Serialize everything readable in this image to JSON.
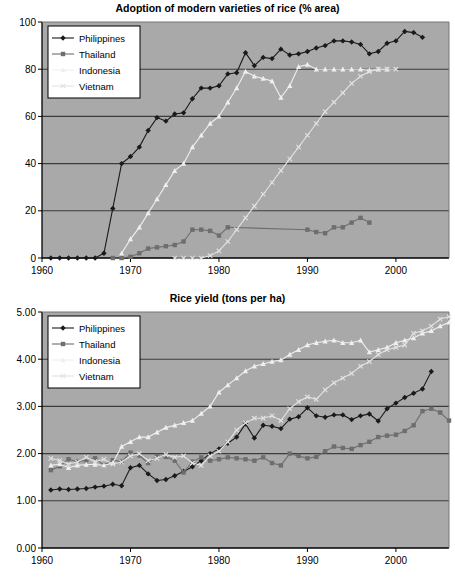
{
  "page": {
    "background": "#ffffff",
    "plot_background": "#a9a9a9",
    "grid_color": "#3c3c3c",
    "axis_color": "#000000"
  },
  "series_style": {
    "Philippines": {
      "color": "#1a1a1a",
      "marker": "diamond"
    },
    "Thailand": {
      "color": "#6e6e6e",
      "marker": "square"
    },
    "Indonesia": {
      "color": "#efefef",
      "marker": "triangle"
    },
    "Vietnam": {
      "color": "#e2e2e2",
      "marker": "cross"
    }
  },
  "chart_data": [
    {
      "id": "chart1",
      "type": "line",
      "title": "Adoption of modern varieties of rice (% area)",
      "xlabel": "",
      "ylabel": "",
      "xlim": [
        1960,
        2006
      ],
      "ylim": [
        0,
        100
      ],
      "xticks": [
        1960,
        1970,
        1980,
        1990,
        2000
      ],
      "yticks": [
        0,
        20,
        40,
        60,
        80,
        100
      ],
      "xtick_labels": [
        "1960",
        "1970",
        "1980",
        "1990",
        "2000"
      ],
      "ytick_labels": [
        "0",
        "20",
        "40",
        "60",
        "80",
        "100"
      ],
      "grid": true,
      "legend_position": "top-left",
      "legend": [
        "Philippines",
        "Thailand",
        "Indonesia",
        "Vietnam"
      ],
      "series": [
        {
          "name": "Philippines",
          "x": [
            1961,
            1962,
            1963,
            1964,
            1965,
            1966,
            1967,
            1968,
            1969,
            1970,
            1971,
            1972,
            1973,
            1974,
            1975,
            1976,
            1977,
            1978,
            1979,
            1980,
            1981,
            1982,
            1983,
            1984,
            1985,
            1986,
            1987,
            1988,
            1989,
            1990,
            1991,
            1992,
            1993,
            1994,
            1995,
            1996,
            1997,
            1998,
            1999,
            2000,
            2001,
            2002,
            2003
          ],
          "y": [
            0,
            0,
            0,
            0,
            0,
            0,
            2,
            21,
            40,
            43,
            47,
            54,
            59.5,
            58,
            61,
            61.5,
            67.5,
            72,
            72,
            73,
            78,
            78.5,
            87,
            81.5,
            85,
            84.5,
            88.5,
            86,
            86.5,
            87.5,
            89,
            90,
            92,
            92,
            91.5,
            90.5,
            86.5,
            87.5,
            91,
            92,
            96,
            95.5,
            93.5
          ]
        },
        {
          "name": "Thailand",
          "x": [
            1968,
            1969,
            1970,
            1971,
            1972,
            1973,
            1974,
            1975,
            1976,
            1977,
            1978,
            1979,
            1980,
            1981,
            1990,
            1991,
            1992,
            1993,
            1994,
            1995,
            1996,
            1997
          ],
          "y": [
            0,
            0,
            0.5,
            2,
            4,
            4.5,
            5,
            5.5,
            7,
            12,
            12,
            11.5,
            9.5,
            13,
            12,
            11,
            10.5,
            13,
            13,
            15,
            17,
            15
          ]
        },
        {
          "name": "Indonesia",
          "x": [
            1969,
            1970,
            1971,
            1972,
            1973,
            1974,
            1975,
            1976,
            1977,
            1978,
            1979,
            1980,
            1981,
            1982,
            1983,
            1984,
            1985,
            1986,
            1987,
            1988,
            1989,
            1990,
            1991,
            1992,
            1993,
            1994,
            1995,
            1996,
            1997,
            1998,
            1999
          ],
          "y": [
            2,
            8,
            13,
            19,
            25,
            31,
            37,
            40,
            47,
            52,
            57,
            60,
            66,
            72,
            79,
            77,
            76,
            75,
            68,
            73,
            81,
            82,
            80,
            80,
            80,
            80,
            80,
            80,
            79.5,
            80,
            80
          ]
        },
        {
          "name": "Vietnam",
          "x": [
            1975,
            1976,
            1977,
            1978,
            1979,
            1980,
            1981,
            1982,
            1983,
            1984,
            1985,
            1986,
            1987,
            1988,
            1989,
            1990,
            1991,
            1992,
            1993,
            1994,
            1995,
            1996,
            1997,
            1998,
            1999,
            2000
          ],
          "y": [
            0,
            0,
            0,
            0,
            1,
            3,
            7,
            12,
            17,
            22,
            27,
            32,
            37,
            42,
            47,
            52,
            57,
            62,
            66,
            70,
            74,
            77,
            79,
            80,
            80,
            80
          ]
        }
      ]
    },
    {
      "id": "chart2",
      "type": "line",
      "title": "Rice yield (tons per ha)",
      "xlabel": "",
      "ylabel": "",
      "xlim": [
        1960,
        2006
      ],
      "ylim": [
        0.0,
        5.0
      ],
      "xticks": [
        1960,
        1970,
        1980,
        1990,
        2000
      ],
      "yticks": [
        0.0,
        1.0,
        2.0,
        3.0,
        4.0,
        5.0
      ],
      "xtick_labels": [
        "1960",
        "1970",
        "1980",
        "1990",
        "2000"
      ],
      "ytick_labels": [
        "0.00",
        "1.00",
        "2.00",
        "3.00",
        "4.00",
        "5.00"
      ],
      "grid": true,
      "legend_position": "top-left",
      "legend": [
        "Philippines",
        "Thailand",
        "Indonesia",
        "Vietnam"
      ],
      "series": [
        {
          "name": "Philippines",
          "x": [
            1961,
            1962,
            1963,
            1964,
            1965,
            1966,
            1967,
            1968,
            1969,
            1970,
            1971,
            1972,
            1973,
            1974,
            1975,
            1976,
            1977,
            1978,
            1979,
            1980,
            1981,
            1982,
            1983,
            1984,
            1985,
            1986,
            1987,
            1988,
            1989,
            1990,
            1991,
            1992,
            1993,
            1994,
            1995,
            1996,
            1997,
            1998,
            1999,
            2000,
            2001,
            2002,
            2003,
            2004
          ],
          "y": [
            1.23,
            1.25,
            1.24,
            1.25,
            1.26,
            1.29,
            1.31,
            1.35,
            1.32,
            1.7,
            1.75,
            1.57,
            1.43,
            1.45,
            1.53,
            1.62,
            1.72,
            1.85,
            2.0,
            2.1,
            2.22,
            2.35,
            2.63,
            2.33,
            2.6,
            2.58,
            2.53,
            2.73,
            2.78,
            2.97,
            2.8,
            2.77,
            2.82,
            2.82,
            2.72,
            2.8,
            2.84,
            2.69,
            2.95,
            3.07,
            3.19,
            3.28,
            3.37,
            3.74
          ]
        },
        {
          "name": "Thailand",
          "x": [
            1961,
            1962,
            1963,
            1964,
            1965,
            1966,
            1967,
            1968,
            1969,
            1970,
            1971,
            1972,
            1973,
            1974,
            1975,
            1976,
            1977,
            1978,
            1979,
            1980,
            1981,
            1982,
            1983,
            1984,
            1985,
            1986,
            1987,
            1988,
            1989,
            1990,
            1991,
            1992,
            1993,
            1994,
            1995,
            1996,
            1997,
            1998,
            1999,
            2000,
            2001,
            2002,
            2003,
            2004,
            2005,
            2006
          ],
          "y": [
            1.65,
            1.73,
            1.88,
            1.83,
            1.86,
            1.9,
            1.75,
            1.86,
            1.83,
            2.02,
            1.96,
            1.8,
            1.95,
            1.93,
            1.85,
            1.6,
            1.83,
            1.92,
            1.85,
            1.88,
            1.92,
            1.9,
            1.88,
            1.85,
            1.92,
            1.8,
            1.75,
            2.0,
            1.95,
            1.9,
            1.93,
            2.05,
            2.15,
            2.12,
            2.1,
            2.18,
            2.25,
            2.35,
            2.38,
            2.4,
            2.48,
            2.6,
            2.9,
            2.95,
            2.87,
            2.7
          ]
        },
        {
          "name": "Indonesia",
          "x": [
            1961,
            1962,
            1963,
            1964,
            1965,
            1966,
            1967,
            1968,
            1969,
            1970,
            1971,
            1972,
            1973,
            1974,
            1975,
            1976,
            1977,
            1978,
            1979,
            1980,
            1981,
            1982,
            1983,
            1984,
            1985,
            1986,
            1987,
            1988,
            1989,
            1990,
            1991,
            1992,
            1993,
            1994,
            1995,
            1996,
            1997,
            1998,
            1999,
            2000,
            2001,
            2002,
            2003,
            2004,
            2005,
            2006
          ],
          "y": [
            1.75,
            1.78,
            1.7,
            1.75,
            1.77,
            1.77,
            1.75,
            1.8,
            2.15,
            2.25,
            2.35,
            2.35,
            2.45,
            2.55,
            2.6,
            2.65,
            2.7,
            2.85,
            3.0,
            3.3,
            3.45,
            3.6,
            3.75,
            3.85,
            3.9,
            3.95,
            3.98,
            4.1,
            4.2,
            4.3,
            4.35,
            4.38,
            4.4,
            4.35,
            4.35,
            4.4,
            4.15,
            4.2,
            4.25,
            4.35,
            4.4,
            4.45,
            4.55,
            4.6,
            4.7,
            4.78
          ]
        },
        {
          "name": "Vietnam",
          "x": [
            1961,
            1962,
            1963,
            1964,
            1965,
            1966,
            1967,
            1968,
            1969,
            1970,
            1971,
            1972,
            1973,
            1974,
            1975,
            1976,
            1977,
            1978,
            1979,
            1980,
            1981,
            1982,
            1983,
            1984,
            1985,
            1986,
            1987,
            1988,
            1989,
            1990,
            1991,
            1992,
            1993,
            1994,
            1995,
            1996,
            1997,
            1998,
            1999,
            2000,
            2001,
            2002,
            2003,
            2004,
            2005,
            2006
          ],
          "y": [
            1.9,
            1.85,
            1.78,
            1.82,
            1.92,
            1.83,
            1.88,
            1.78,
            1.82,
            1.95,
            2.0,
            1.85,
            1.9,
            1.98,
            1.92,
            1.95,
            1.8,
            1.75,
            1.95,
            2.05,
            2.25,
            2.5,
            2.65,
            2.75,
            2.75,
            2.8,
            2.7,
            2.95,
            3.1,
            3.2,
            3.15,
            3.35,
            3.5,
            3.6,
            3.7,
            3.85,
            3.95,
            4.1,
            4.2,
            4.25,
            4.3,
            4.55,
            4.6,
            4.7,
            4.85,
            4.9
          ]
        }
      ]
    }
  ]
}
